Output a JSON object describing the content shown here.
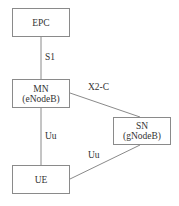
{
  "diagram": {
    "nodes": {
      "epc": {
        "line1": "EPC"
      },
      "mn": {
        "line1": "MN",
        "line2": "(eNodeB)"
      },
      "sn": {
        "line1": "SN",
        "line2": "(gNodeB)"
      },
      "ue": {
        "line1": "UE"
      }
    },
    "edges": {
      "epc_mn": {
        "label": "S1"
      },
      "mn_sn": {
        "label": "X2-C"
      },
      "mn_ue": {
        "label": "Uu"
      },
      "sn_ue": {
        "label": "Uu"
      }
    }
  }
}
